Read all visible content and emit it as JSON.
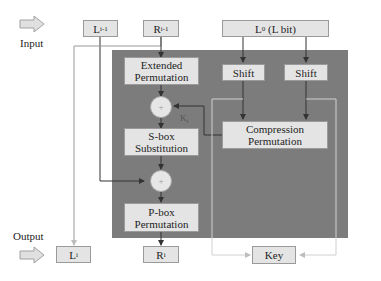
{
  "diagram": {
    "labels": {
      "input": "Input",
      "output": "Output"
    },
    "boxes": {
      "l_prev": {
        "main": "L",
        "sub": "i-1"
      },
      "r_prev": {
        "main": "R",
        "sub": "i-1"
      },
      "l0": {
        "main": "L",
        "sub": "0",
        "suffix": " (L bit)"
      },
      "extended_permutation": "Extended Permutation",
      "shift_left": "Shift",
      "shift_right": "Shift",
      "sbox": "S-box Substitution",
      "compression_permutation": "Compression Permutation",
      "pbox": "P-box Permutation",
      "l_out": {
        "main": "L",
        "sub": "i"
      },
      "r_out": {
        "main": "R",
        "sub": "i"
      },
      "key": "Key"
    },
    "xor_symbol": "+",
    "round_key": {
      "main": "K",
      "sub": "i"
    },
    "colors": {
      "panel": "#7c7c7c",
      "box_fill": "#e4e4e4",
      "line_dark": "#333333",
      "line_light": "#d0d0d0"
    }
  }
}
